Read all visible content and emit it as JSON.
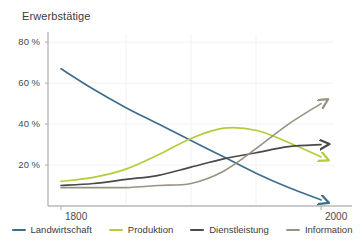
{
  "chart_data": {
    "type": "line",
    "title": "Erwerbstätige",
    "xlabel": "",
    "ylabel": "",
    "xlim": [
      1790,
      2010
    ],
    "ylim": [
      0,
      84
    ],
    "grid": true,
    "legend_position": "bottom",
    "y_ticks": [
      "80 %",
      "60 %",
      "40 %",
      "20 %"
    ],
    "y_tick_values": [
      80,
      60,
      40,
      20
    ],
    "x_ticks": [
      "1800",
      "2000"
    ],
    "x_tick_values": [
      1800,
      2000
    ],
    "x": [
      1800,
      1825,
      1850,
      1875,
      1900,
      1925,
      1950,
      1975,
      2000
    ],
    "series": [
      {
        "name": "Landwirtschaft",
        "color": "#3d6e8e",
        "values": [
          67,
          57,
          48,
          40,
          32,
          24,
          16,
          9,
          3
        ]
      },
      {
        "name": "Produktion",
        "color": "#b5cc3a",
        "values": [
          12,
          14,
          18,
          25,
          33,
          38,
          37,
          31,
          24
        ]
      },
      {
        "name": "Dienstleistung",
        "color": "#4a4a4a",
        "values": [
          10,
          11,
          13,
          15,
          19,
          23,
          26,
          29,
          30
        ]
      },
      {
        "name": "Information",
        "color": "#9a9384",
        "values": [
          9,
          9,
          9,
          10,
          11,
          17,
          28,
          40,
          50
        ]
      }
    ],
    "annotations": [
      "Each series terminates with an arrowhead at the right edge (2000)."
    ]
  },
  "axes": {
    "axis_color": "#b8b8b8",
    "grid_color": "#f2f2f2"
  },
  "legend": {
    "items": [
      {
        "label": "Landwirtschaft",
        "color": "#3d6e8e"
      },
      {
        "label": "Produktion",
        "color": "#b5cc3a"
      },
      {
        "label": "Dienstleistung",
        "color": "#4a4a4a"
      },
      {
        "label": "Information",
        "color": "#9a9384"
      }
    ]
  }
}
